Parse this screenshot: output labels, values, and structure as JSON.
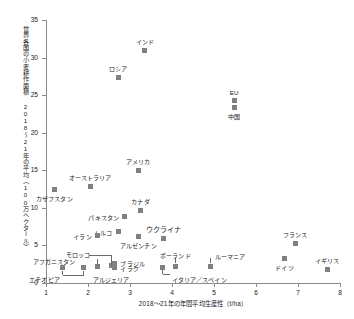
{
  "chart_data": {
    "type": "scatter",
    "title": "",
    "xlabel": "2018〜21年の年間平均生産性（t/ha）",
    "ylabel": "世界各国の小麦耕作面積 2018〜21年の平均（100万ヘクタール）",
    "xlim": [
      1,
      8
    ],
    "ylim": [
      0,
      35
    ],
    "xticks": [
      "1",
      "2",
      "3",
      "4",
      "5",
      "6",
      "7",
      "8"
    ],
    "yticks": [
      "0",
      "5",
      "10",
      "15",
      "20",
      "25",
      "30",
      "35"
    ],
    "grid": false,
    "legend": "none",
    "marker_color": "#808080",
    "points": [
      {
        "label": "インド",
        "x": 3.35,
        "y": 30.9
      },
      {
        "label": "ロシア",
        "x": 2.72,
        "y": 27.4
      },
      {
        "label": "EU",
        "x": 5.48,
        "y": 24.3
      },
      {
        "label": "中国",
        "x": 5.48,
        "y": 23.4
      },
      {
        "label": "アメリカ",
        "x": 3.2,
        "y": 15.0
      },
      {
        "label": "オーストラリア",
        "x": 2.05,
        "y": 12.9
      },
      {
        "label": "カザフスタン",
        "x": 1.2,
        "y": 12.5
      },
      {
        "label": "カナダ",
        "x": 3.25,
        "y": 9.7
      },
      {
        "label": "パキスタン",
        "x": 2.88,
        "y": 8.9
      },
      {
        "label": "トルコ",
        "x": 2.72,
        "y": 6.9
      },
      {
        "label": "イラン",
        "x": 2.23,
        "y": 6.3
      },
      {
        "label": "アルゼンチン",
        "x": 3.2,
        "y": 6.2
      },
      {
        "label": "ウクライナ",
        "x": 3.8,
        "y": 5.9
      },
      {
        "label": "フランス",
        "x": 6.93,
        "y": 5.2
      },
      {
        "label": "ドイツ",
        "x": 6.68,
        "y": 3.2
      },
      {
        "label": "ブラジル",
        "x": 2.63,
        "y": 2.6
      },
      {
        "label": "モロッコ",
        "x": 2.55,
        "y": 2.3
      },
      {
        "label": "アルジェリア",
        "x": 1.9,
        "y": 2.0
      },
      {
        "label": "イラク",
        "x": 2.63,
        "y": 2.0
      },
      {
        "label": "エチオピア",
        "x": 1.4,
        "y": 2.0
      },
      {
        "label": "アフガニスタン",
        "x": 2.22,
        "y": 2.2
      },
      {
        "label": "イタリア／スペイン",
        "x": 3.78,
        "y": 2.1
      },
      {
        "label": "ポーランド",
        "x": 4.08,
        "y": 2.2
      },
      {
        "label": "ルーマニア",
        "x": 4.92,
        "y": 2.2
      },
      {
        "label": "イギリス",
        "x": 7.7,
        "y": 1.8
      }
    ]
  }
}
